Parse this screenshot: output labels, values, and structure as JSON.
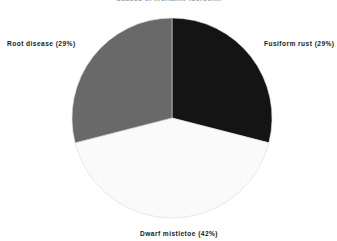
{
  "chart_data": {
    "type": "pie",
    "title": "Causes of mortality (percent)",
    "categories": [
      "Fusiform rust",
      "Dwarf mistletoe",
      "Root disease"
    ],
    "values": [
      29,
      42,
      29
    ],
    "value_unit": "%",
    "labels": [
      "Fusiform rust (29%)",
      "Dwarf mistletoe (42%)",
      "Root disease (29%)"
    ],
    "slice_colors": [
      "#141414",
      "#fafafa",
      "#696969"
    ],
    "start_angle_deg": 0,
    "direction": "clockwise",
    "legend": "none",
    "grid": false,
    "xlabel": "",
    "ylabel": ""
  },
  "figure": {
    "background": "#ffffff",
    "width": 337,
    "height": 241,
    "center_x": 172,
    "center_y": 118,
    "radius": 100,
    "outline_color": "#d8d8d8"
  },
  "labels": {
    "root_disease": "Root disease (29%)",
    "fusiform_rust": "Fusiform rust (29%)",
    "dwarf_mistletoe": "Dwarf mistletoe (42%)"
  }
}
